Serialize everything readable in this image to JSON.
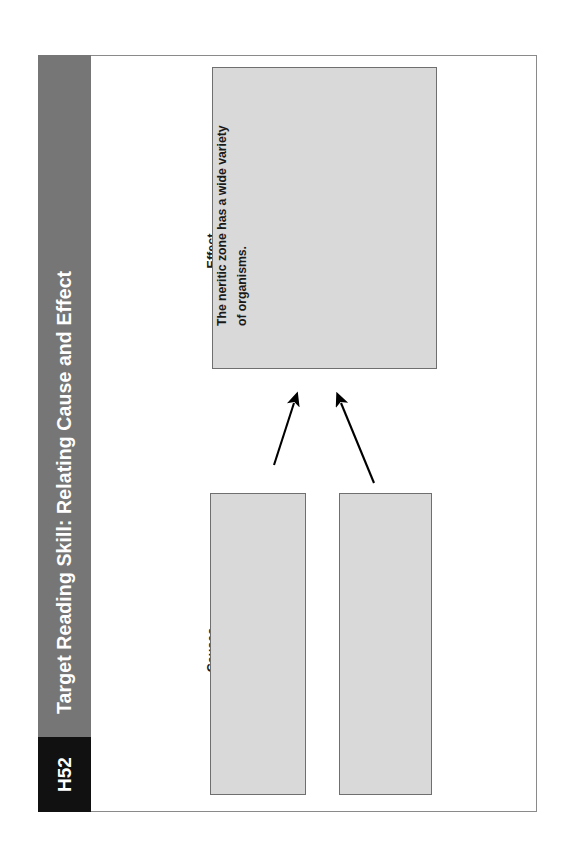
{
  "page": {
    "code_badge": "H52",
    "header_title": "Target Reading Skill: Relating Cause and Effect"
  },
  "organizer": {
    "type": "cause-and-effect-graphic-organizer",
    "effect": {
      "label": "Effect",
      "box": {
        "filled": true,
        "line_1": "The neritic zone has a wide variety",
        "line_2": "of organisms."
      }
    },
    "causes": {
      "label": "Causes",
      "boxes": [
        {
          "id": "cause-1",
          "filled": false,
          "text": ""
        },
        {
          "id": "cause-2",
          "filled": false,
          "text": ""
        }
      ]
    },
    "arrows": [
      {
        "id": "arrow-cause-1-to-effect",
        "from": "cause-1",
        "to": "effect"
      },
      {
        "id": "arrow-cause-2-to-effect",
        "from": "cause-2",
        "to": "effect"
      }
    ]
  },
  "colors": {
    "header_band": "#767676",
    "code_badge": "#111111",
    "box_fill": "#d9d9d9",
    "box_border": "#6f6f6f",
    "page_border": "#8a8a8a",
    "text": "#1a1a1a",
    "header_text": "#ffffff"
  }
}
